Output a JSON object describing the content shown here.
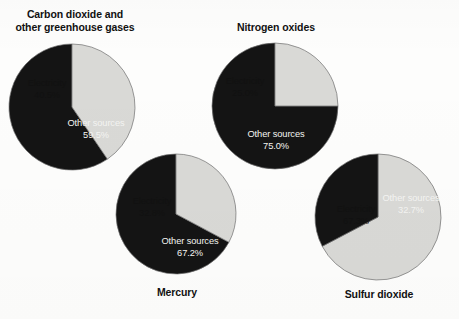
{
  "figure": {
    "background_color": "#fdfdfc",
    "slice_colors": {
      "electricity": "#d9d9d6",
      "other_sources": "#141414",
      "outline": "#6f6f6f"
    }
  },
  "charts": [
    {
      "id": "carbon-dioxide",
      "title": "Carbon dioxide and\nother greenhouse gases",
      "title_position": "top",
      "slices": [
        {
          "label": "Electricity",
          "value_label": "40.5%",
          "value": 40.5,
          "color": "#d9d9d6"
        },
        {
          "label": "Other sources",
          "value_label": "59.5%",
          "value": 59.5,
          "color": "#141414"
        }
      ]
    },
    {
      "id": "nitrogen-oxides",
      "title": "Nitrogen oxides",
      "title_position": "top",
      "slices": [
        {
          "label": "Electricity",
          "value_label": "25.0%",
          "value": 25.0,
          "color": "#d9d9d6"
        },
        {
          "label": "Other sources",
          "value_label": "75.0%",
          "value": 75.0,
          "color": "#141414"
        }
      ]
    },
    {
      "id": "mercury",
      "title": "Mercury",
      "title_position": "bottom",
      "slices": [
        {
          "label": "Electricity",
          "value_label": "32.8%",
          "value": 32.8,
          "color": "#d9d9d6"
        },
        {
          "label": "Other sources",
          "value_label": "67.2%",
          "value": 67.2,
          "color": "#141414"
        }
      ]
    },
    {
      "id": "sulfur-dioxide",
      "title": "Sulfur dioxide",
      "title_position": "bottom",
      "slices": [
        {
          "label": "Electricity",
          "value_label": "67.3%",
          "value": 67.3,
          "color": "#d9d9d6"
        },
        {
          "label": "Other sources",
          "value_label": "32.7%",
          "value": 32.7,
          "color": "#141414"
        }
      ]
    }
  ],
  "chart_data": [
    {
      "type": "pie",
      "title": "Carbon dioxide and other greenhouse gases",
      "categories": [
        "Electricity",
        "Other sources"
      ],
      "values": [
        40.5,
        59.5
      ],
      "value_labels": [
        "40.5%",
        "59.5%"
      ],
      "units": "percent",
      "colors": [
        "#d9d9d6",
        "#141414"
      ],
      "start_angle_deg": 0,
      "direction": "clockwise",
      "legend": "in-slice labels"
    },
    {
      "type": "pie",
      "title": "Nitrogen oxides",
      "categories": [
        "Electricity",
        "Other sources"
      ],
      "values": [
        25.0,
        75.0
      ],
      "value_labels": [
        "25.0%",
        "75.0%"
      ],
      "units": "percent",
      "colors": [
        "#d9d9d6",
        "#141414"
      ],
      "start_angle_deg": 0,
      "direction": "clockwise",
      "legend": "in-slice labels"
    },
    {
      "type": "pie",
      "title": "Mercury",
      "categories": [
        "Electricity",
        "Other sources"
      ],
      "values": [
        32.8,
        67.2
      ],
      "value_labels": [
        "32.8%",
        "67.2%"
      ],
      "units": "percent",
      "colors": [
        "#d9d9d6",
        "#141414"
      ],
      "start_angle_deg": 0,
      "direction": "clockwise",
      "legend": "in-slice labels"
    },
    {
      "type": "pie",
      "title": "Sulfur dioxide",
      "categories": [
        "Electricity",
        "Other sources"
      ],
      "values": [
        67.3,
        32.7
      ],
      "value_labels": [
        "67.3%",
        "32.7%"
      ],
      "units": "percent",
      "colors": [
        "#d9d9d6",
        "#141414"
      ],
      "start_angle_deg": 0,
      "direction": "clockwise",
      "legend": "in-slice labels"
    }
  ]
}
